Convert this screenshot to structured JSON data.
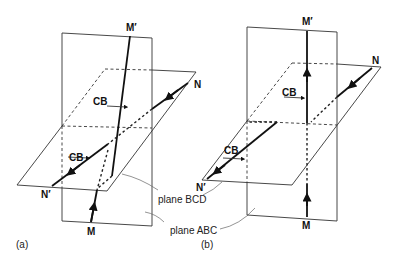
{
  "figure": {
    "panels": [
      {
        "id": "a",
        "caption": "(a)",
        "labels": {
          "top": "M′",
          "bottom": "M",
          "right": "N",
          "left": "N′",
          "cb_upper": "CB",
          "cb_lower": "CB"
        }
      },
      {
        "id": "b",
        "caption": "(b)",
        "labels": {
          "top": "M′",
          "bottom": "M",
          "right": "N",
          "left": "N′",
          "cb_upper": "CB",
          "cb_lower": "CB"
        }
      }
    ],
    "callouts": {
      "plane_bcd": "plane BCD",
      "plane_abc": "plane ABC"
    }
  }
}
